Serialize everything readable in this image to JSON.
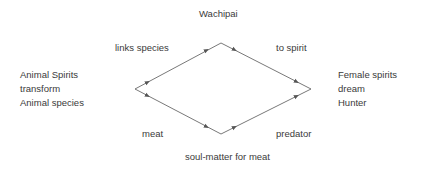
{
  "diagram": {
    "type": "diamond-relationship",
    "colors": {
      "line": "#555555",
      "text": "#3a3a3a",
      "background": "#ffffff"
    },
    "nodes": {
      "top": "Wachipai",
      "left": [
        "Animal Spirits",
        "transform",
        "Animal species"
      ],
      "right": [
        "Female spirits",
        "dream",
        "Hunter"
      ],
      "bottom": "soul-matter for meat"
    },
    "edges": {
      "top_left": "links species",
      "top_right": "to spirit",
      "bottom_left": "meat",
      "bottom_right": "predator"
    },
    "vertices": {
      "top": [
        221,
        43
      ],
      "left": [
        135,
        89
      ],
      "bottom": [
        221,
        134
      ],
      "right": [
        311,
        89
      ]
    },
    "arrow_style": "double-headed"
  }
}
